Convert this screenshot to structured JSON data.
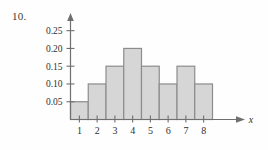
{
  "problem": {
    "number": "10."
  },
  "chart_data": {
    "type": "bar",
    "title": "",
    "subtitle": "",
    "xlabel": "x",
    "ylabel": "",
    "categories": [
      "1",
      "2",
      "3",
      "4",
      "5",
      "6",
      "7",
      "8"
    ],
    "values": [
      0.05,
      0.1,
      0.15,
      0.2,
      0.15,
      0.1,
      0.15,
      0.1
    ],
    "ytick_labels": [
      "0.25",
      "0.20",
      "0.15",
      "0.10",
      "0.05"
    ],
    "ytick_values": [
      0.25,
      0.2,
      0.15,
      0.1,
      0.05
    ],
    "ylim": [
      0,
      0.28
    ],
    "xlim": [
      0.5,
      8.5
    ],
    "grid": false,
    "legend": null,
    "legend_position": "none",
    "axis_arrows": [
      "x-axis-arrow",
      "y-axis-arrow"
    ],
    "bar_fill_color": "#d6d6d6",
    "bar_edge_color": "#8c8c8c",
    "axis_color": "#6f6f6f",
    "background_color": "#fefefe",
    "annotations": []
  }
}
